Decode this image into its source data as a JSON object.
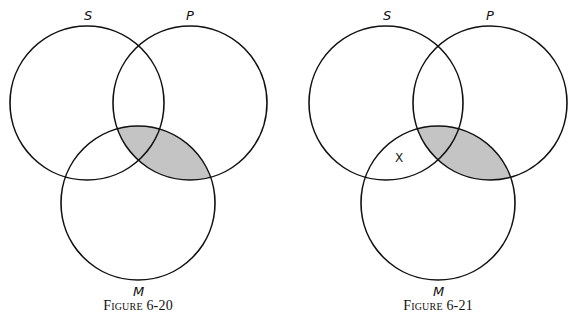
{
  "figures": [
    {
      "caption": "Figure 6-20",
      "labels": {
        "s": "S",
        "p": "P",
        "m": "M"
      },
      "circles": {
        "s": {
          "cx": 87,
          "cy": 103,
          "r": 77
        },
        "p": {
          "cx": 190,
          "cy": 103,
          "r": 77
        },
        "m": {
          "cx": 138,
          "cy": 203,
          "r": 77
        }
      },
      "shaded_region": "P ∩ M",
      "marks": []
    },
    {
      "caption": "Figure 6-21",
      "labels": {
        "s": "S",
        "p": "P",
        "m": "M"
      },
      "circles": {
        "s": {
          "cx": 386,
          "cy": 103,
          "r": 77
        },
        "p": {
          "cx": 490,
          "cy": 103,
          "r": 77
        },
        "m": {
          "cx": 438,
          "cy": 203,
          "r": 77
        }
      },
      "shaded_region": "P ∩ M",
      "marks": [
        {
          "text": "X",
          "region": "S ∩ M outside P"
        }
      ]
    }
  ],
  "colors": {
    "stroke": "#111111",
    "shade": "#c4c4c4",
    "background": "#ffffff"
  }
}
